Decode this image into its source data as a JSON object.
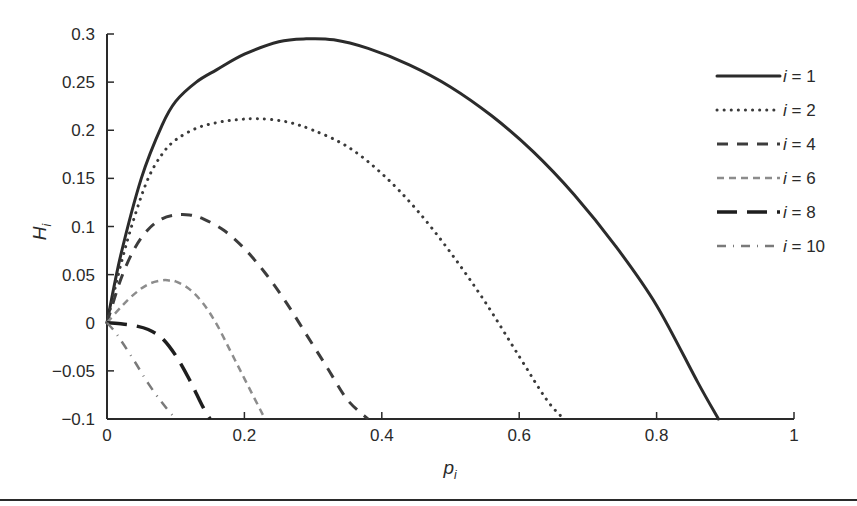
{
  "chart_data": {
    "type": "line",
    "title": "",
    "xlabel": "p_i",
    "ylabel": "H_i",
    "xlim": [
      0,
      1
    ],
    "ylim": [
      -0.1,
      0.3
    ],
    "grid": false,
    "legend_position": "upper right",
    "x_ticks": [
      0,
      0.2,
      0.4,
      0.6,
      0.8,
      1
    ],
    "x_tick_labels": [
      "0",
      "0.2",
      "0.4",
      "0.6",
      "0.8",
      "1"
    ],
    "y_ticks": [
      -0.1,
      -0.05,
      0,
      0.05,
      0.1,
      0.15,
      0.2,
      0.25,
      0.3
    ],
    "y_tick_labels": [
      "−0.1",
      "−0.05",
      "0",
      "0.05",
      "0.1",
      "0.15",
      "0.2",
      "0.25",
      "0.3"
    ],
    "series": [
      {
        "name": "i = 1",
        "style": "solid",
        "color": "#2b2b2b",
        "x": [
          0,
          0.02,
          0.05,
          0.08,
          0.1,
          0.13,
          0.16,
          0.2,
          0.25,
          0.29,
          0.33,
          0.38,
          0.44,
          0.5,
          0.56,
          0.62,
          0.68,
          0.74,
          0.8,
          0.86,
          0.89
        ],
        "y": [
          0,
          0.07,
          0.15,
          0.205,
          0.23,
          0.25,
          0.263,
          0.279,
          0.292,
          0.295,
          0.294,
          0.285,
          0.268,
          0.245,
          0.215,
          0.178,
          0.133,
          0.08,
          0.018,
          -0.062,
          -0.1
        ]
      },
      {
        "name": "i = 2",
        "style": "dotted",
        "color": "#3a3a3a",
        "x": [
          0,
          0.02,
          0.04,
          0.06,
          0.08,
          0.1,
          0.13,
          0.16,
          0.19,
          0.22,
          0.26,
          0.3,
          0.35,
          0.4,
          0.45,
          0.5,
          0.55,
          0.6,
          0.64,
          0.665
        ],
        "y": [
          0,
          0.06,
          0.11,
          0.15,
          0.175,
          0.19,
          0.202,
          0.208,
          0.211,
          0.212,
          0.209,
          0.2,
          0.183,
          0.155,
          0.118,
          0.073,
          0.022,
          -0.035,
          -0.08,
          -0.1
        ]
      },
      {
        "name": "i = 4",
        "style": "dashed",
        "color": "#3c3c3c",
        "x": [
          0,
          0.02,
          0.04,
          0.06,
          0.08,
          0.1,
          0.12,
          0.14,
          0.17,
          0.2,
          0.23,
          0.26,
          0.29,
          0.32,
          0.35,
          0.38
        ],
        "y": [
          0,
          0.045,
          0.077,
          0.097,
          0.108,
          0.112,
          0.112,
          0.108,
          0.096,
          0.077,
          0.052,
          0.022,
          -0.012,
          -0.046,
          -0.08,
          -0.1
        ]
      },
      {
        "name": "i = 6",
        "style": "short-dashed",
        "color": "#8c8c8c",
        "x": [
          0,
          0.02,
          0.04,
          0.06,
          0.08,
          0.09,
          0.1,
          0.12,
          0.14,
          0.16,
          0.18,
          0.2,
          0.23
        ],
        "y": [
          0,
          0.016,
          0.03,
          0.04,
          0.044,
          0.044,
          0.043,
          0.035,
          0.02,
          -0.002,
          -0.03,
          -0.058,
          -0.1
        ]
      },
      {
        "name": "i = 8",
        "style": "long-dashed",
        "color": "#1e1e1e",
        "x": [
          0,
          0.02,
          0.04,
          0.06,
          0.08,
          0.1,
          0.12,
          0.14,
          0.15
        ],
        "y": [
          0,
          -0.001,
          -0.003,
          -0.007,
          -0.016,
          -0.034,
          -0.059,
          -0.088,
          -0.1
        ]
      },
      {
        "name": "i = 10",
        "style": "dash-dot",
        "color": "#7a7a7a",
        "x": [
          0,
          0.01,
          0.02,
          0.04,
          0.06,
          0.08,
          0.1
        ],
        "y": [
          0,
          -0.008,
          -0.018,
          -0.04,
          -0.063,
          -0.083,
          -0.1
        ]
      }
    ]
  },
  "axes": {
    "xlabel_main": "p",
    "xlabel_sub": "i",
    "ylabel_main": "H",
    "ylabel_sub": "i"
  },
  "legend": {
    "items": [
      {
        "prefix": "i",
        "text": " = 1"
      },
      {
        "prefix": "i",
        "text": " = 2"
      },
      {
        "prefix": "i",
        "text": " = 4"
      },
      {
        "prefix": "i",
        "text": " = 6"
      },
      {
        "prefix": "i",
        "text": " = 8"
      },
      {
        "prefix": "i",
        "text": " = 10"
      }
    ]
  }
}
